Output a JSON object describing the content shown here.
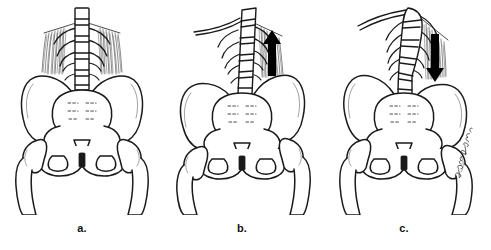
{
  "figure": {
    "background_color": "#ffffff",
    "line_color": "#1a1a1a",
    "accent_color": "#000000",
    "panel_count": 3,
    "caption_labels": [
      "a.",
      "b.",
      "c."
    ]
  },
  "panels": [
    {
      "id": "panel-a",
      "label": "a.",
      "condition": "normal-level-pelvis",
      "spine_alignment": "vertical-symmetric",
      "muscle_hatching": "bilateral",
      "arrow": "none",
      "arrow_direction": "",
      "signature": ""
    },
    {
      "id": "panel-b",
      "label": "b.",
      "condition": "pelvic-obliquity-elevated",
      "spine_alignment": "tilted-right",
      "muscle_hatching": "right-only",
      "arrow": "up-arrow",
      "arrow_direction": "up",
      "signature": ""
    },
    {
      "id": "panel-c",
      "label": "c.",
      "condition": "pelvic-obliquity-depressed",
      "spine_alignment": "curved-scoliotic",
      "muscle_hatching": "right-only",
      "arrow": "down-arrow",
      "arrow_direction": "down",
      "signature": "artist-signature"
    }
  ],
  "anatomy": {
    "spine": "lumbar-spine",
    "sacrum": "sacrum",
    "coccyx": "coccyx",
    "ilium_left": "left-ilium",
    "ilium_right": "right-ilium",
    "femur_left": "left-femur",
    "femur_right": "right-femur",
    "pubic_symphysis": "pubic-symphysis",
    "obturator_left": "left-obturator-foramen",
    "obturator_right": "right-obturator-foramen",
    "ribs": "lower-ribs",
    "muscle": "quadratus-lumborum-muscle"
  }
}
